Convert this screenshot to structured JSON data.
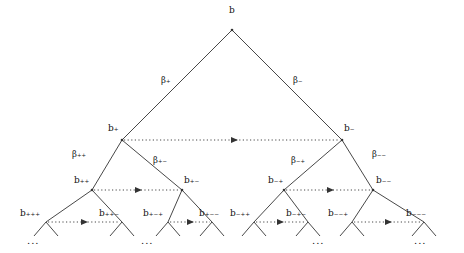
{
  "diagram": {
    "type": "binary-tree",
    "title": "",
    "root": {
      "label": "b",
      "x": 232,
      "y": 12
    },
    "nodes": [
      {
        "id": "b",
        "label": "b",
        "lx": 229,
        "ly": 6,
        "px": 232,
        "py": 30
      },
      {
        "id": "bp",
        "label": "b₊",
        "lx": 112,
        "ly": 124,
        "px": 122,
        "py": 140
      },
      {
        "id": "bm",
        "label": "b₋",
        "lx": 342,
        "ly": 124,
        "px": 342,
        "py": 140
      },
      {
        "id": "bpp",
        "label": "b₊₊",
        "lx": 80,
        "ly": 177,
        "px": 92,
        "py": 190
      },
      {
        "id": "bpm",
        "label": "b₊₋",
        "lx": 185,
        "ly": 177,
        "px": 182,
        "py": 190
      },
      {
        "id": "bmp",
        "label": "b₋₊",
        "lx": 272,
        "ly": 177,
        "px": 284,
        "py": 190
      },
      {
        "id": "bmm",
        "label": "b₋₋",
        "lx": 376,
        "ly": 177,
        "px": 373,
        "py": 190
      },
      {
        "id": "bppp",
        "label": "b₊₊₊",
        "lx": 22,
        "ly": 209,
        "px": 46,
        "py": 222
      },
      {
        "id": "bppm",
        "label": "b₊₊₋",
        "lx": 100,
        "ly": 209,
        "px": 122,
        "py": 222
      },
      {
        "id": "bpmp",
        "label": "b₊₋₊",
        "lx": 146,
        "ly": 209,
        "px": 168,
        "py": 222
      },
      {
        "id": "bpmm",
        "label": "b₊₋₋",
        "lx": 200,
        "ly": 209,
        "px": 212,
        "py": 222
      },
      {
        "id": "bmpp",
        "label": "b₋₊₊",
        "lx": 232,
        "ly": 209,
        "px": 254,
        "py": 222
      },
      {
        "id": "bmpm",
        "label": "b₋₊₋",
        "lx": 288,
        "ly": 209,
        "px": 308,
        "py": 222
      },
      {
        "id": "bmmp",
        "label": "b₋₋₊",
        "lx": 330,
        "ly": 209,
        "px": 352,
        "py": 222
      },
      {
        "id": "bmmm",
        "label": "b₋₋₋",
        "lx": 408,
        "ly": 209,
        "px": 424,
        "py": 222
      }
    ],
    "edge_labels": [
      {
        "id": "beta-plus",
        "label": "β₊",
        "x": 164,
        "y": 79
      },
      {
        "id": "beta-minus",
        "label": "β₋",
        "x": 296,
        "y": 79
      },
      {
        "id": "beta-plus-plus",
        "label": "β₊₊",
        "x": 78,
        "y": 152
      },
      {
        "id": "beta-plus-minus",
        "label": "β₊₋",
        "x": 157,
        "y": 158
      },
      {
        "id": "beta-minus-plus",
        "label": "β₋₊",
        "x": 296,
        "y": 158
      },
      {
        "id": "beta-minus-minus",
        "label": "β₋₋",
        "x": 376,
        "y": 152
      }
    ],
    "ellipses": [
      {
        "id": "ellipsis-1",
        "label": "...",
        "x": 33,
        "y": 238
      },
      {
        "id": "ellipsis-2",
        "label": "...",
        "x": 147,
        "y": 238
      },
      {
        "id": "ellipsis-3",
        "label": "...",
        "x": 318,
        "y": 238
      },
      {
        "id": "ellipsis-4",
        "label": "...",
        "x": 420,
        "y": 238
      }
    ],
    "colors": {
      "stroke": "#333333",
      "text": "#111111",
      "background": "#ffffff"
    }
  }
}
